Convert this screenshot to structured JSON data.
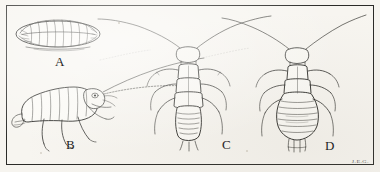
{
  "plate": {
    "title": "Entomological illustration plate",
    "caption_style": "engraving",
    "background_color": "#f6f4ef",
    "ink_color": "#272724",
    "frame_color": "#2b2b28",
    "signature": "J.E.G."
  },
  "figures": [
    {
      "id": "A",
      "label": "A",
      "name": "egg-or-pupa-dorsal",
      "description": "Oval lens-shaped segmented body with ribbed transverse striations, viewed from above",
      "view": "dorsal",
      "label_x": 55,
      "label_y": 55
    },
    {
      "id": "B",
      "label": "B",
      "name": "nymph-lateral",
      "description": "Lateral view of segmented larva with legs, head and long antenna",
      "view": "lateral",
      "label_x": 66,
      "label_y": 138
    },
    {
      "id": "C",
      "label": "C",
      "name": "nymph-dorsal-slender",
      "description": "Dorsal view, slender elongated abdomen, six legs, two long antennae",
      "view": "dorsal",
      "label_x": 222,
      "label_y": 138
    },
    {
      "id": "D",
      "label": "D",
      "name": "nymph-dorsal-broad",
      "description": "Dorsal view, broad rounded abdomen with terminal cerci, six legs, two long antennae",
      "view": "dorsal",
      "label_x": 325,
      "label_y": 139
    }
  ]
}
